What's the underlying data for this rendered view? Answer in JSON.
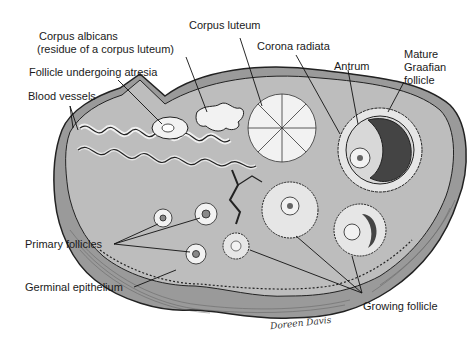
{
  "diagram": {
    "labels": {
      "corpus_albicans": "Corpus albicans",
      "corpus_albicans_note": "(residue of a corpus luteum)",
      "follicle_atresia": "Follicle undergoing atresia",
      "blood_vessels": "Blood vessels",
      "corpus_luteum": "Corpus luteum",
      "corona_radiata": "Corona radiata",
      "antrum": "Antrum",
      "mature_line1": "Mature",
      "mature_line2": "Graafian",
      "mature_line3": "follicle",
      "primary_follicles": "Primary follicles",
      "germinal_epithelium": "Germinal epithelium",
      "growing_follicle": "Growing follicle"
    },
    "signature": "Doreen Davis",
    "colors": {
      "tissue": "#bdbdbd",
      "capsule": "#9a9a9a",
      "outline": "#222222",
      "light_structure": "#f2f2f2",
      "follicle_fill": "#e6e6e6"
    }
  }
}
